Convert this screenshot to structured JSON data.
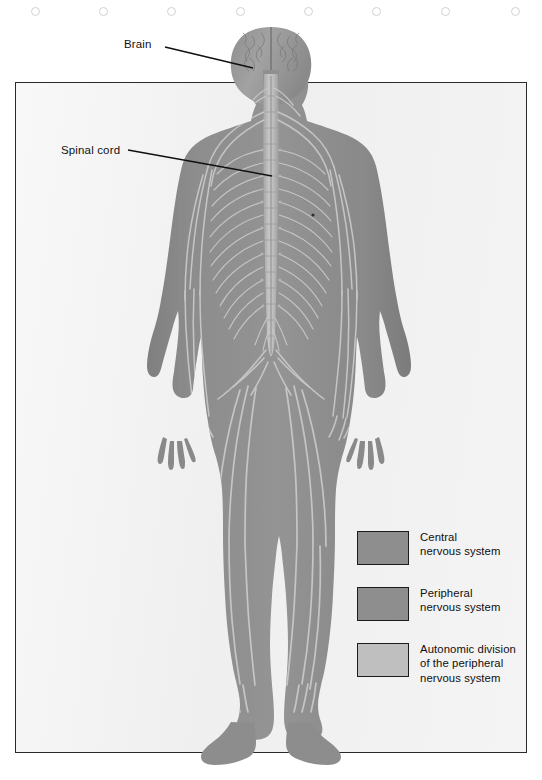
{
  "page": {
    "background_color": "#ffffff",
    "figure_panel": {
      "background_color": "#f0f0f0",
      "border_color": "#2a2a2a"
    }
  },
  "punch_holes": {
    "count": 8,
    "x_positions": [
      31,
      99,
      167,
      236,
      304,
      372,
      441,
      511
    ],
    "color": "#d2d2d6"
  },
  "callouts": [
    {
      "id": "brain",
      "label": "Brain",
      "leader_from": [
        165,
        47
      ],
      "leader_to": [
        253,
        68
      ]
    },
    {
      "id": "spinal_cord",
      "label": "Spinal cord",
      "leader_from": [
        128,
        150
      ],
      "leader_to": [
        272,
        176
      ]
    }
  ],
  "figure": {
    "title_alt": "Human nervous system full body diagram",
    "body_color": "#8b8b8b",
    "nerve_color": "#c9c9c9",
    "spinal_cord_color": "#b4b4b4",
    "brain_color": "#9a9a9a"
  },
  "legend": {
    "items": [
      {
        "swatch_color": "#8e8e8e",
        "lines": [
          "Central",
          "nervous system"
        ]
      },
      {
        "swatch_color": "#8e8e8e",
        "lines": [
          "Peripheral",
          "nervous system"
        ]
      },
      {
        "swatch_color": "#bfbfbf",
        "lines": [
          "Autonomic division",
          "of the peripheral",
          "nervous system"
        ]
      }
    ]
  }
}
